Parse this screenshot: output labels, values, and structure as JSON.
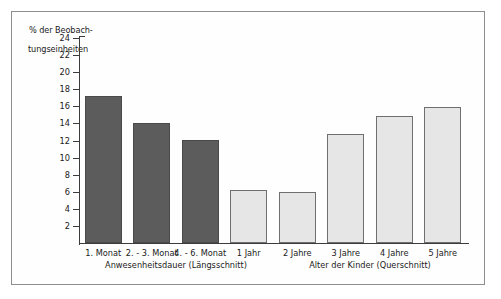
{
  "figure": {
    "y_axis_title_line1": "% der Beobach-",
    "y_axis_title_line2": "tungseinheiten",
    "caption": "",
    "frame_color": "#8d8d8d",
    "axis_color": "#3c3c3c"
  },
  "chart_data": {
    "type": "bar",
    "title": "",
    "xlabel": "",
    "ylabel": "% der Beobachtungseinheiten",
    "ylim": [
      0,
      24
    ],
    "yticks": [
      2,
      4,
      6,
      8,
      10,
      12,
      14,
      16,
      18,
      20,
      22,
      24
    ],
    "ytick_labels": [
      "2",
      "4",
      "6",
      "8",
      "10",
      "12",
      "14",
      "16",
      "18",
      "20",
      "22",
      "24"
    ],
    "grid": false,
    "legend_position": "none",
    "categories": [
      "1. Monat",
      "2. - 3. Monat",
      "4. - 6. Monat",
      "1 Jahr",
      "2 Jahre",
      "3 Jahre",
      "4 Jahre",
      "5 Jahre"
    ],
    "values": [
      17.2,
      14.0,
      12.1,
      6.2,
      6.0,
      12.8,
      14.9,
      15.9
    ],
    "bar_colors": [
      "#5c5c5c",
      "#5c5c5c",
      "#5c5c5c",
      "#e6e6e6",
      "#e6e6e6",
      "#e6e6e6",
      "#e6e6e6",
      "#e6e6e6"
    ],
    "groups": [
      {
        "label": "Anwesenheitsdauer (Längsschnitt)",
        "categories": [
          "1. Monat",
          "2. - 3. Monat",
          "4. - 6. Monat",
          "1 Jahr"
        ]
      },
      {
        "label": "Alter der Kinder (Querschnitt)",
        "categories": [
          "2 Jahre",
          "3 Jahre",
          "4 Jahre",
          "5 Jahre"
        ]
      }
    ]
  }
}
